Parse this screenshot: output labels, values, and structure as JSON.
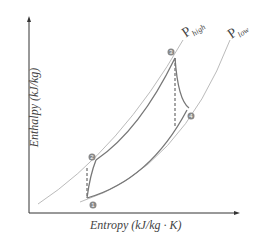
{
  "diagram": {
    "type": "enthalpy-entropy (h-s) diagram",
    "axes": {
      "y_label": "Enthalpy (kJ/kg)",
      "x_label": "Entropy (kJ/kg · K)"
    },
    "isobars": [
      {
        "name": "P",
        "sub": "high"
      },
      {
        "name": "P",
        "sub": "low"
      }
    ],
    "points": [
      {
        "id": "1",
        "label": "1"
      },
      {
        "id": "2",
        "label": "2"
      },
      {
        "id": "3",
        "label": "3"
      },
      {
        "id": "4",
        "label": "4"
      }
    ],
    "colors": {
      "isobar": "#bbbbbb",
      "cycle": "#777777",
      "axis": "#333333",
      "point": "#888888"
    }
  }
}
